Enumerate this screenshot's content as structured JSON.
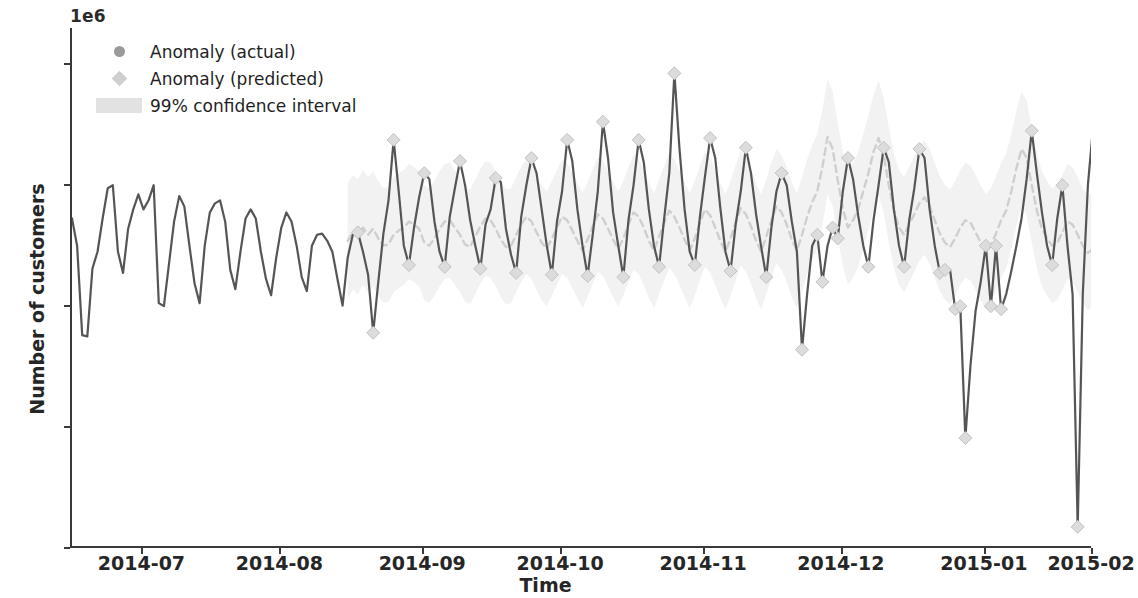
{
  "figure": {
    "offset_label": "1e6",
    "xlabel": "Time",
    "ylabel": "Number of customers"
  },
  "legend": {
    "items": [
      {
        "label": "Anomaly (actual)",
        "marker": "circle",
        "color": "#9a9a9a"
      },
      {
        "label": "Anomaly (predicted)",
        "marker": "diamond",
        "color": "#cfcfcf"
      },
      {
        "label": "99% confidence interval",
        "marker": "band",
        "color": "#e2e2e2"
      }
    ]
  },
  "chart_data": {
    "type": "line",
    "title": "",
    "xlabel": "Time",
    "ylabel": "Number of customers",
    "y_offset_label": "1e6",
    "ylim": [
      0.2,
      1.06
    ],
    "yticks": [
      "0.2",
      "0.4",
      "0.6",
      "0.8",
      "1.0"
    ],
    "ytick_values": [
      0.2,
      0.4,
      0.6,
      0.8,
      1.0
    ],
    "xticks": [
      "2014-07",
      "2014-08",
      "2014-09",
      "2014-10",
      "2014-11",
      "2014-12",
      "2015-01",
      "2015-02"
    ],
    "xtick_positions": [
      0.07,
      0.205,
      0.345,
      0.48,
      0.62,
      0.755,
      0.895,
      1.0
    ],
    "grid": false,
    "legend_position": "upper left",
    "colors": {
      "actual_line": "#555555",
      "predicted_line": "#cfcfcf",
      "confidence_band": "#ededed",
      "axis": "#3a3a3a",
      "text": "#262626"
    },
    "series": [
      {
        "name": "Anomaly (actual)",
        "style": "solid",
        "marker": "circle",
        "values": [
          0.745,
          0.7,
          0.552,
          0.55,
          0.662,
          0.69,
          0.745,
          0.795,
          0.8,
          0.69,
          0.655,
          0.728,
          0.76,
          0.785,
          0.76,
          0.775,
          0.8,
          0.605,
          0.6,
          0.67,
          0.74,
          0.782,
          0.765,
          0.7,
          0.638,
          0.605,
          0.7,
          0.755,
          0.77,
          0.775,
          0.74,
          0.66,
          0.628,
          0.69,
          0.745,
          0.76,
          0.745,
          0.69,
          0.645,
          0.618,
          0.68,
          0.73,
          0.755,
          0.74,
          0.7,
          0.648,
          0.625,
          0.7,
          0.718,
          0.72,
          0.708,
          0.69,
          0.645,
          0.601,
          0.68,
          0.718,
          0.722,
          0.69,
          0.652,
          0.556,
          0.64,
          0.72,
          0.775,
          0.875,
          0.79,
          0.7,
          0.668,
          0.73,
          0.78,
          0.82,
          0.81,
          0.74,
          0.69,
          0.665,
          0.748,
          0.795,
          0.84,
          0.8,
          0.742,
          0.7,
          0.662,
          0.735,
          0.76,
          0.812,
          0.805,
          0.728,
          0.685,
          0.655,
          0.748,
          0.8,
          0.845,
          0.82,
          0.76,
          0.7,
          0.652,
          0.74,
          0.79,
          0.875,
          0.84,
          0.76,
          0.7,
          0.65,
          0.718,
          0.79,
          0.905,
          0.845,
          0.755,
          0.7,
          0.648,
          0.742,
          0.8,
          0.875,
          0.838,
          0.76,
          0.7,
          0.665,
          0.745,
          0.82,
          0.985,
          0.86,
          0.76,
          0.69,
          0.668,
          0.748,
          0.815,
          0.878,
          0.845,
          0.762,
          0.69,
          0.658,
          0.735,
          0.79,
          0.862,
          0.82,
          0.752,
          0.698,
          0.648,
          0.73,
          0.79,
          0.82,
          0.8,
          0.74,
          0.69,
          0.528,
          0.62,
          0.7,
          0.718,
          0.64,
          0.7,
          0.73,
          0.712,
          0.79,
          0.845,
          0.81,
          0.75,
          0.7,
          0.665,
          0.742,
          0.8,
          0.862,
          0.838,
          0.76,
          0.7,
          0.665,
          0.742,
          0.795,
          0.86,
          0.845,
          0.76,
          0.7,
          0.655,
          0.66,
          0.66,
          0.595,
          0.6,
          0.382,
          0.502,
          0.592,
          0.64,
          0.7,
          0.6,
          0.7,
          0.595,
          0.62,
          0.658,
          0.7,
          0.745,
          0.81,
          0.89,
          0.82,
          0.755,
          0.7,
          0.668,
          0.745,
          0.8,
          0.7,
          0.62,
          0.235,
          0.62,
          0.8,
          0.895
        ]
      },
      {
        "name": "Anomaly (predicted)",
        "style": "dashed",
        "marker": "diamond",
        "start_index": 54,
        "values": [
          0.708,
          0.722,
          0.715,
          0.73,
          0.718,
          0.728,
          0.712,
          0.7,
          0.702,
          0.718,
          0.725,
          0.73,
          0.74,
          0.735,
          0.728,
          0.705,
          0.7,
          0.712,
          0.728,
          0.74,
          0.742,
          0.73,
          0.718,
          0.702,
          0.698,
          0.715,
          0.732,
          0.745,
          0.742,
          0.728,
          0.71,
          0.698,
          0.7,
          0.718,
          0.735,
          0.748,
          0.74,
          0.722,
          0.705,
          0.695,
          0.712,
          0.73,
          0.748,
          0.742,
          0.725,
          0.708,
          0.692,
          0.71,
          0.732,
          0.752,
          0.745,
          0.728,
          0.71,
          0.695,
          0.712,
          0.735,
          0.755,
          0.748,
          0.73,
          0.708,
          0.692,
          0.715,
          0.738,
          0.758,
          0.748,
          0.73,
          0.71,
          0.692,
          0.712,
          0.738,
          0.76,
          0.75,
          0.73,
          0.708,
          0.69,
          0.712,
          0.738,
          0.762,
          0.752,
          0.732,
          0.708,
          0.69,
          0.715,
          0.742,
          0.765,
          0.755,
          0.735,
          0.71,
          0.692,
          0.718,
          0.748,
          0.772,
          0.79,
          0.83,
          0.88,
          0.86,
          0.808,
          0.762,
          0.73,
          0.742,
          0.76,
          0.79,
          0.82,
          0.855,
          0.878,
          0.85,
          0.8,
          0.758,
          0.73,
          0.718,
          0.735,
          0.752,
          0.77,
          0.78,
          0.765,
          0.742,
          0.72,
          0.705,
          0.698,
          0.712,
          0.73,
          0.742,
          0.738,
          0.722,
          0.705,
          0.69,
          0.7,
          0.72,
          0.742,
          0.758,
          0.79,
          0.828,
          0.86,
          0.845,
          0.8,
          0.758,
          0.728,
          0.712,
          0.7,
          0.705,
          0.722,
          0.74,
          0.735,
          0.718,
          0.7,
          0.688,
          0.695,
          0.71,
          0.722,
          0.718,
          0.705,
          0.692,
          0.682,
          0.69,
          0.7,
          0.705
        ]
      }
    ],
    "confidence_interval": {
      "label": "99% confidence interval",
      "level": 0.99,
      "half_width": 0.095,
      "start_index": 54
    }
  }
}
